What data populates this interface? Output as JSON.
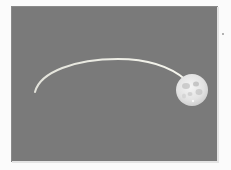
{
  "image": {
    "description": "Full moon at the end of a curved light trail on a gray background",
    "background_color": "#fbfbfb",
    "panel_color": "#7a7a7a",
    "trail": {
      "color": "#e8e8d8",
      "start": [
        35,
        92
      ],
      "apex": [
        112,
        59
      ],
      "end": [
        184,
        82
      ]
    },
    "moon": {
      "center": [
        192,
        90
      ],
      "radius": 16,
      "color": "#e6e6e6"
    }
  }
}
